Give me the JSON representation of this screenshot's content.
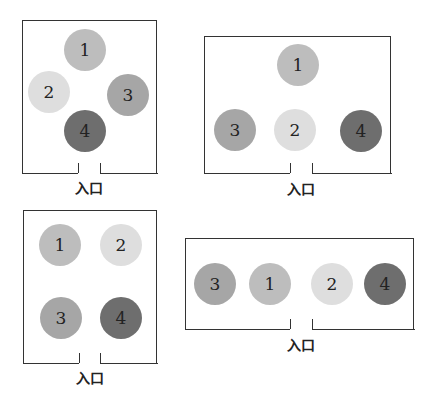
{
  "colors": {
    "1": "#bdbdbd",
    "2": "#dedede",
    "3": "#a6a6a6",
    "4": "#6e6e6e"
  },
  "entrance_label": "入口",
  "layouts": [
    {
      "id": "layout-a",
      "box": {
        "left": 22,
        "top": 20,
        "right": 157,
        "bottom": 173
      },
      "gap": [
        78,
        100
      ],
      "label_pos": [
        89,
        177
      ],
      "circles": [
        {
          "label": "1",
          "cx": 85,
          "cy": 50
        },
        {
          "label": "2",
          "cx": 49,
          "cy": 92
        },
        {
          "label": "3",
          "cx": 128,
          "cy": 95
        },
        {
          "label": "4",
          "cx": 85,
          "cy": 131
        }
      ]
    },
    {
      "id": "layout-b",
      "box": {
        "left": 204,
        "top": 36,
        "right": 391,
        "bottom": 173
      },
      "gap": [
        290,
        312
      ],
      "label_pos": [
        301,
        178
      ],
      "circles": [
        {
          "label": "1",
          "cx": 298,
          "cy": 65
        },
        {
          "label": "3",
          "cx": 235,
          "cy": 130
        },
        {
          "label": "2",
          "cx": 295,
          "cy": 130
        },
        {
          "label": "4",
          "cx": 361,
          "cy": 131
        }
      ]
    },
    {
      "id": "layout-c",
      "box": {
        "left": 23,
        "top": 210,
        "right": 157,
        "bottom": 363
      },
      "gap": [
        79,
        100
      ],
      "label_pos": [
        90,
        367
      ],
      "circles": [
        {
          "label": "1",
          "cx": 60,
          "cy": 245
        },
        {
          "label": "2",
          "cx": 121,
          "cy": 245
        },
        {
          "label": "3",
          "cx": 61,
          "cy": 318
        },
        {
          "label": "4",
          "cx": 121,
          "cy": 318
        }
      ]
    },
    {
      "id": "layout-d",
      "box": {
        "left": 185,
        "top": 238,
        "right": 414,
        "bottom": 329
      },
      "gap": [
        290,
        312
      ],
      "label_pos": [
        301,
        334
      ],
      "circles": [
        {
          "label": "3",
          "cx": 215,
          "cy": 284
        },
        {
          "label": "1",
          "cx": 270,
          "cy": 284
        },
        {
          "label": "2",
          "cx": 332,
          "cy": 284
        },
        {
          "label": "4",
          "cx": 385,
          "cy": 284
        }
      ]
    }
  ]
}
